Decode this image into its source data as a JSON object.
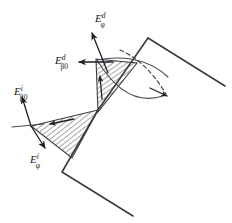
{
  "figure": {
    "background_color": "#ffffff",
    "line_color": "#3b3b41",
    "label_color": "#1a1a1a",
    "width": 232,
    "height": 223
  },
  "labels": {
    "diffracted_phi": {
      "base": "E",
      "sup": "d",
      "sub": "φ",
      "x": 95,
      "y": 22
    },
    "diffracted_beta0": {
      "base": "E",
      "sup": "d",
      "sub": "β0",
      "x": 55,
      "y": 64
    },
    "incident_beta0": {
      "base": "E",
      "sup": "i",
      "sub": "β0",
      "x": 14,
      "y": 95
    },
    "incident_phi": {
      "base": "E",
      "sup": "i",
      "sub": "φ",
      "x": 30,
      "y": 160
    }
  },
  "geometry": {
    "wedge_outline": "M 148,38 L 98,110 L 62,172 L 133,216",
    "wedge_upper_face": "M 148,38 L 225,86",
    "upper_shaded_triangle": "M 98,112 L 96,59 L 137,63 Z",
    "lower_shaded_triangle": "M 31,126 L 98,110 L 72,158 Z",
    "cone_arc_upper": "M 97,60 Q 140,53 168,76",
    "cone_arc_lower": "M 97,60 Q 128,108 166,95",
    "dashed_arc": "M 136,45 Q 158,62 167,94",
    "hatch_spacing": 4
  },
  "arrows": {
    "diffracted_phi_arrow": {
      "from": [
        108,
        72
      ],
      "to": [
        92,
        34
      ]
    },
    "diffracted_beta0_arrow": {
      "from": [
        113,
        62
      ],
      "to": [
        78,
        62
      ]
    },
    "incident_beta0_arrow": {
      "from": [
        31,
        126
      ],
      "to": [
        22,
        98
      ]
    },
    "incident_phi_arrow": {
      "from": [
        31,
        126
      ],
      "to": [
        44,
        147
      ]
    },
    "upper_face_tick": {
      "from": [
        102,
        98
      ],
      "to": [
        100,
        77
      ]
    },
    "lower_face_tick": {
      "from": [
        72,
        120
      ],
      "to": [
        48,
        125
      ]
    },
    "cone_tip_arrow": {
      "from": [
        152,
        88
      ],
      "to": [
        168,
        96
      ]
    }
  },
  "icon_names": [
    "arrow-head-icon",
    "hatch-pattern-icon",
    "dashed-arc-icon"
  ]
}
